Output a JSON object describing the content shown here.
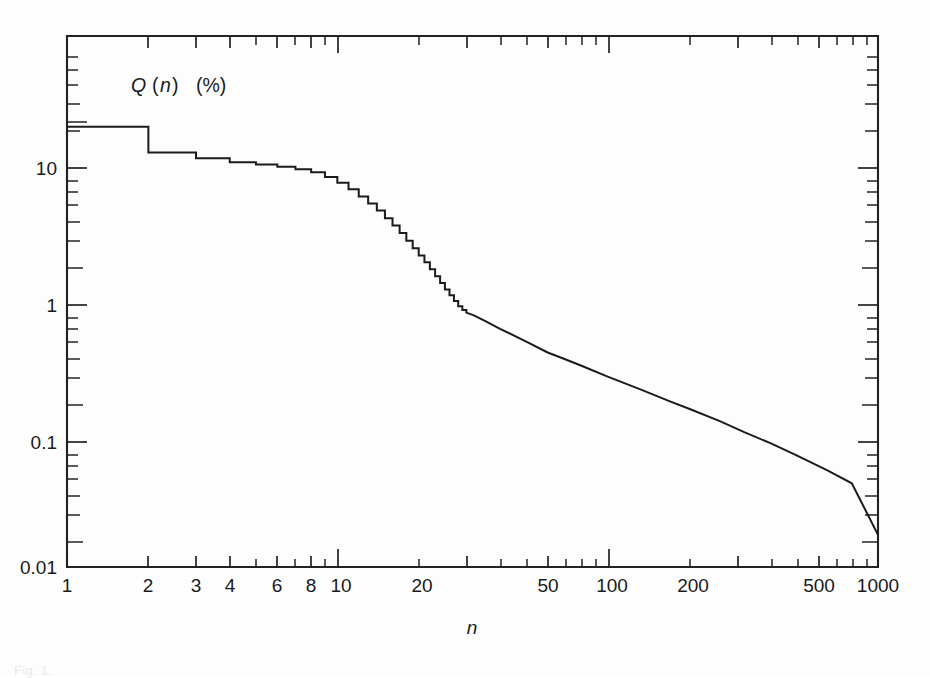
{
  "figure": {
    "annotation": "Q (n)  (%)",
    "annotation_symbol": "Q",
    "annotation_arg": "n",
    "annotation_unit": "(%)",
    "caption": "Fig. 1."
  },
  "chart_data": {
    "type": "line",
    "xlabel": "n",
    "ylabel": "Q (n)  (%)",
    "xscale": "log",
    "yscale": "log",
    "xlim": [
      1,
      1000
    ],
    "ylim": [
      0.01,
      30
    ],
    "grid": false,
    "legend": null,
    "xticks": [
      1,
      2,
      3,
      4,
      6,
      8,
      10,
      20,
      50,
      100,
      200,
      500,
      1000
    ],
    "xtick_labels": [
      "1",
      "2",
      "3",
      "4",
      "6",
      "8",
      "10",
      "20",
      "50",
      "100",
      "200",
      "500",
      "1000"
    ],
    "yticks": [
      10,
      1,
      0.1,
      0.01
    ],
    "ytick_labels": [
      "10",
      "1",
      "0.1",
      "0.01"
    ],
    "series": [
      {
        "name": "Q(n)",
        "style": "staircase-then-smooth",
        "x": [
          1,
          2,
          2,
          3,
          3,
          4,
          4,
          5,
          5,
          6,
          6,
          7,
          7,
          8,
          8,
          9,
          9,
          10,
          10,
          11,
          11,
          12,
          12,
          13,
          13,
          14,
          14,
          15,
          15,
          16,
          16,
          17,
          17,
          18,
          18,
          19,
          19,
          20,
          20,
          21,
          21,
          22,
          22,
          23,
          23,
          24,
          24,
          25,
          25,
          26,
          26,
          27,
          27,
          28,
          28,
          29,
          29,
          30,
          30,
          32,
          35,
          40,
          50,
          60,
          70,
          80,
          100,
          130,
          170,
          200,
          260,
          320,
          400,
          500,
          650,
          800,
          1000
        ],
        "y": [
          20.0,
          20.0,
          13.0,
          13.0,
          11.8,
          11.8,
          11.0,
          11.0,
          10.6,
          10.6,
          10.2,
          10.2,
          9.8,
          9.8,
          9.3,
          9.3,
          8.6,
          8.6,
          7.8,
          7.8,
          7.0,
          7.0,
          6.2,
          6.2,
          5.5,
          5.5,
          4.9,
          4.9,
          4.3,
          4.3,
          3.8,
          3.8,
          3.35,
          3.35,
          2.95,
          2.95,
          2.6,
          2.6,
          2.3,
          2.3,
          2.05,
          2.05,
          1.82,
          1.82,
          1.62,
          1.62,
          1.45,
          1.45,
          1.3,
          1.3,
          1.18,
          1.18,
          1.07,
          1.07,
          0.98,
          0.98,
          0.92,
          0.92,
          0.88,
          0.84,
          0.77,
          0.67,
          0.54,
          0.45,
          0.4,
          0.36,
          0.3,
          0.245,
          0.198,
          0.175,
          0.142,
          0.118,
          0.098,
          0.08,
          0.062,
          0.05,
          0.021
        ]
      }
    ],
    "annotations": [
      {
        "text": "Q (n)  (%)",
        "x": 2.0,
        "y": 26.0
      }
    ]
  }
}
